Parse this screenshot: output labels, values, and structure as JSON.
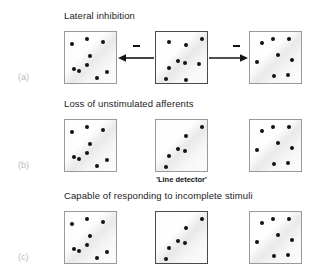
{
  "figure": {
    "width": 318,
    "height": 275,
    "background": "#ffffff",
    "dot_color": "#121212",
    "panel_fill": "#f4f4f4",
    "panel_border": "#9a9a9a",
    "panel_border_strong": "#4a4a4a",
    "label_color": "#b9b9b9"
  },
  "rows": [
    {
      "letter": "(a)",
      "title": "Lateral inhibition",
      "caption": "",
      "panels": [
        {
          "name": "cortical-map-a-left",
          "emphasis": "normal",
          "dots": [
            [
              0.42,
              0.13
            ],
            [
              0.71,
              0.19
            ],
            [
              0.13,
              0.23
            ],
            [
              0.48,
              0.46
            ],
            [
              0.42,
              0.63
            ],
            [
              0.17,
              0.69
            ],
            [
              0.26,
              0.73
            ],
            [
              0.6,
              0.86
            ],
            [
              0.8,
              0.76
            ]
          ]
        },
        {
          "name": "cortical-map-a-middle",
          "emphasis": "strong",
          "dots": [
            [
              0.24,
              0.19
            ],
            [
              0.56,
              0.25
            ],
            [
              0.87,
              0.13
            ],
            [
              0.41,
              0.55
            ],
            [
              0.55,
              0.58
            ],
            [
              0.81,
              0.6
            ],
            [
              0.25,
              0.68
            ],
            [
              0.19,
              0.88
            ],
            [
              0.56,
              0.91
            ]
          ]
        },
        {
          "name": "cortical-map-a-right",
          "emphasis": "normal",
          "dots": [
            [
              0.22,
              0.21
            ],
            [
              0.44,
              0.13
            ],
            [
              0.73,
              0.14
            ],
            [
              0.52,
              0.43
            ],
            [
              0.14,
              0.56
            ],
            [
              0.8,
              0.53
            ],
            [
              0.46,
              0.83
            ],
            [
              0.72,
              0.82
            ]
          ]
        }
      ],
      "connectors": [
        {
          "name": "inhibition-arrow-left",
          "direction": "left",
          "sign": "minus"
        },
        {
          "name": "inhibition-arrow-right",
          "direction": "right",
          "sign": "minus"
        }
      ]
    },
    {
      "letter": "(b)",
      "title": "Loss of unstimulated afferents",
      "caption": "'Line detector'",
      "panels": [
        {
          "name": "cortical-map-b-left",
          "emphasis": "normal",
          "dots": [
            [
              0.42,
              0.13
            ],
            [
              0.71,
              0.19
            ],
            [
              0.13,
              0.23
            ],
            [
              0.48,
              0.46
            ],
            [
              0.42,
              0.63
            ],
            [
              0.17,
              0.69
            ],
            [
              0.26,
              0.73
            ],
            [
              0.6,
              0.86
            ],
            [
              0.8,
              0.76
            ]
          ]
        },
        {
          "name": "cortical-map-b-middle",
          "emphasis": "normal",
          "dots": [
            [
              0.87,
              0.13
            ],
            [
              0.56,
              0.31
            ],
            [
              0.41,
              0.55
            ],
            [
              0.55,
              0.58
            ],
            [
              0.25,
              0.68
            ],
            [
              0.19,
              0.88
            ]
          ]
        },
        {
          "name": "cortical-map-b-right",
          "emphasis": "normal",
          "dots": [
            [
              0.22,
              0.21
            ],
            [
              0.44,
              0.13
            ],
            [
              0.73,
              0.14
            ],
            [
              0.52,
              0.43
            ],
            [
              0.14,
              0.56
            ],
            [
              0.8,
              0.53
            ],
            [
              0.46,
              0.83
            ],
            [
              0.72,
              0.82
            ]
          ]
        }
      ],
      "connectors": []
    },
    {
      "letter": "(c)",
      "title": "Capable of responding to incomplete stimuli",
      "caption": "",
      "panels": [
        {
          "name": "cortical-map-c-left",
          "emphasis": "normal",
          "dots": [
            [
              0.42,
              0.13
            ],
            [
              0.71,
              0.19
            ],
            [
              0.13,
              0.23
            ],
            [
              0.48,
              0.46
            ],
            [
              0.42,
              0.63
            ],
            [
              0.17,
              0.69
            ],
            [
              0.26,
              0.73
            ],
            [
              0.6,
              0.86
            ],
            [
              0.8,
              0.76
            ]
          ]
        },
        {
          "name": "cortical-map-c-middle",
          "emphasis": "strong",
          "dots": [
            [
              0.87,
              0.13
            ],
            [
              0.56,
              0.31
            ],
            [
              0.41,
              0.55
            ],
            [
              0.55,
              0.58
            ],
            [
              0.25,
              0.68
            ],
            [
              0.19,
              0.88
            ]
          ]
        },
        {
          "name": "cortical-map-c-right",
          "emphasis": "normal",
          "dots": [
            [
              0.22,
              0.21
            ],
            [
              0.44,
              0.13
            ],
            [
              0.73,
              0.14
            ],
            [
              0.52,
              0.43
            ],
            [
              0.14,
              0.56
            ],
            [
              0.8,
              0.53
            ],
            [
              0.46,
              0.83
            ],
            [
              0.72,
              0.82
            ]
          ]
        }
      ],
      "connectors": []
    }
  ],
  "layout": {
    "row_tops": [
      10,
      98,
      190
    ],
    "panel_size": 53,
    "panel_xs": [
      64,
      155,
      249
    ],
    "panel_y_offset": 21,
    "title_x": 64,
    "letter_x": 18,
    "letter_y_offset": 62
  }
}
